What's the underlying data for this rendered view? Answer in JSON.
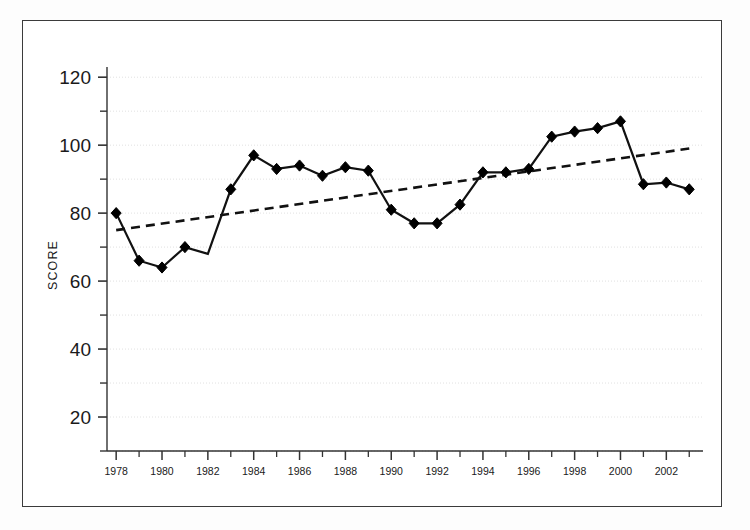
{
  "chart_data": {
    "type": "line",
    "title": "",
    "subtitle": "",
    "xlabel": "",
    "ylabel": "SCORE",
    "xlim": [
      1977.6,
      2003.6
    ],
    "ylim": [
      10,
      123
    ],
    "grid": true,
    "legend_position": "none",
    "x_tick_labels": [
      "1978",
      "1980",
      "1982",
      "1984",
      "1986",
      "1988",
      "1990",
      "1992",
      "1994",
      "1996",
      "1998",
      "2000",
      "2002"
    ],
    "x_tick_values": [
      1978,
      1980,
      1982,
      1984,
      1986,
      1988,
      1990,
      1992,
      1994,
      1996,
      1998,
      2000,
      2002
    ],
    "x_minor_ticks": [
      1979,
      1981,
      1983,
      1985,
      1987,
      1989,
      1991,
      1993,
      1995,
      1997,
      1999,
      2001,
      2003
    ],
    "y_tick_labels": [
      "20",
      "40",
      "60",
      "80",
      "100",
      "120"
    ],
    "y_tick_values": [
      20,
      40,
      60,
      80,
      100,
      120
    ],
    "y_minor_ticks": [
      10,
      30,
      50,
      70,
      90,
      110
    ],
    "x": [
      1978,
      1979,
      1980,
      1981,
      1982,
      1983,
      1984,
      1985,
      1986,
      1987,
      1988,
      1989,
      1990,
      1991,
      1992,
      1993,
      1994,
      1995,
      1996,
      1997,
      1998,
      1999,
      2000,
      2001,
      2002,
      2003
    ],
    "series": [
      {
        "name": "Score",
        "style": "solid",
        "marker": "diamond",
        "color": "#000000",
        "values": [
          80,
          66,
          64,
          70,
          68,
          87,
          97,
          93,
          94,
          91,
          93.5,
          92.5,
          81,
          77,
          77,
          82.5,
          92,
          92,
          93,
          102.5,
          104,
          105,
          107,
          88.5,
          89,
          87
        ],
        "markers_hidden_at_x": [
          1982
        ]
      },
      {
        "name": "Trend",
        "style": "dashed",
        "marker": "none",
        "color": "#000000",
        "x": [
          1978,
          2003
        ],
        "values": [
          75,
          99
        ]
      }
    ]
  },
  "axis": {
    "y_title": "SCORE"
  }
}
